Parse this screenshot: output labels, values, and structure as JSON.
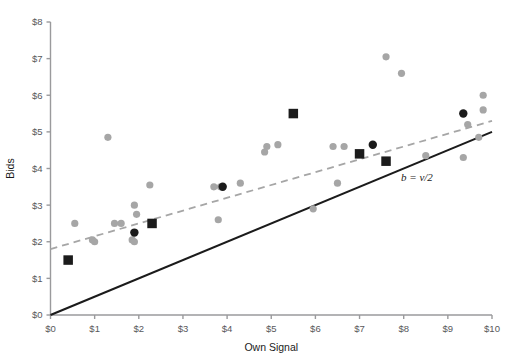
{
  "chart_data": {
    "type": "scatter",
    "title": "",
    "xlabel": "Own Signal",
    "ylabel": "Bids",
    "xlim": [
      0,
      10
    ],
    "ylim": [
      0,
      8
    ],
    "grid": false,
    "legend": "none",
    "xticks": [
      "$0",
      "$1",
      "$2",
      "$3",
      "$4",
      "$5",
      "$6",
      "$7",
      "$8",
      "$9",
      "$10"
    ],
    "xtick_values": [
      0,
      1,
      2,
      3,
      4,
      5,
      6,
      7,
      8,
      9,
      10
    ],
    "yticks": [
      "$0",
      "$1",
      "$2",
      "$3",
      "$4",
      "$5",
      "$6",
      "$7",
      "$8"
    ],
    "ytick_values": [
      0,
      1,
      2,
      3,
      4,
      5,
      6,
      7,
      8
    ],
    "series": [
      {
        "name": "individual-bids",
        "marker": "circle",
        "color": "#a6a6a6",
        "points": [
          [
            0.55,
            2.5
          ],
          [
            0.95,
            2.05
          ],
          [
            1.0,
            2.0
          ],
          [
            1.3,
            4.85
          ],
          [
            1.45,
            2.5
          ],
          [
            1.6,
            2.5
          ],
          [
            1.85,
            2.05
          ],
          [
            1.9,
            3.0
          ],
          [
            1.95,
            2.75
          ],
          [
            1.9,
            2.0
          ],
          [
            2.25,
            3.55
          ],
          [
            3.85,
            3.5
          ],
          [
            3.7,
            3.5
          ],
          [
            3.8,
            2.6
          ],
          [
            4.3,
            3.6
          ],
          [
            4.85,
            4.45
          ],
          [
            4.9,
            4.6
          ],
          [
            5.15,
            4.65
          ],
          [
            5.95,
            2.9
          ],
          [
            6.4,
            4.6
          ],
          [
            6.65,
            4.6
          ],
          [
            6.5,
            3.6
          ],
          [
            7.6,
            7.05
          ],
          [
            7.95,
            6.6
          ],
          [
            8.5,
            4.35
          ],
          [
            9.35,
            4.3
          ],
          [
            9.45,
            5.2
          ],
          [
            9.8,
            6.0
          ],
          [
            9.8,
            5.6
          ],
          [
            9.7,
            4.85
          ]
        ]
      },
      {
        "name": "average-bid-dark-circle",
        "marker": "circle",
        "color": "#1b1b1b",
        "points": [
          [
            1.9,
            2.25
          ],
          [
            3.9,
            3.5
          ],
          [
            7.3,
            4.65
          ],
          [
            9.35,
            5.5
          ]
        ]
      },
      {
        "name": "median-bid-square",
        "marker": "square",
        "color": "#1b1b1b",
        "points": [
          [
            0.4,
            1.5
          ],
          [
            2.3,
            2.5
          ],
          [
            5.5,
            5.5
          ],
          [
            7.0,
            4.4
          ],
          [
            7.6,
            4.2
          ]
        ]
      }
    ],
    "lines": [
      {
        "name": "regression-trend",
        "style": "dashed",
        "color": "#a6a6a6",
        "x": [
          0,
          10
        ],
        "y": [
          1.8,
          5.3
        ],
        "label": ""
      },
      {
        "name": "risk-neutral-nash-line",
        "style": "solid",
        "color": "#1b1b1b",
        "x": [
          0,
          10
        ],
        "y": [
          0,
          5.0
        ],
        "label": "b = v/2"
      }
    ],
    "annotations": [
      {
        "name": "b-equals-v-over-2",
        "text": "b = v/2",
        "x": 8.3,
        "y": 3.65
      }
    ]
  }
}
